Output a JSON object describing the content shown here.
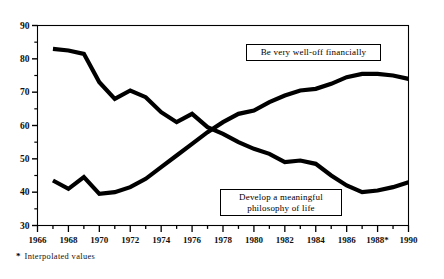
{
  "chart_data": {
    "type": "line",
    "title": "",
    "subtitle": "",
    "xlabel": "",
    "ylabel": "",
    "xlim": [
      1966,
      1990
    ],
    "ylim": [
      30,
      90
    ],
    "grid": false,
    "legend_position": "inline-callout",
    "y_ticks_major": [
      30,
      40,
      50,
      60,
      70,
      80,
      90
    ],
    "y_ticks_minor": [
      35,
      45,
      55,
      65,
      75,
      85
    ],
    "x_ticks_major": [
      "1966",
      "1968",
      "1970",
      "1972",
      "1974",
      "1976",
      "1978",
      "1980",
      "1982",
      "1984",
      "1986",
      "1988*",
      "1990"
    ],
    "x_tick_years_all": [
      1966,
      1967,
      1968,
      1969,
      1970,
      1971,
      1972,
      1973,
      1974,
      1975,
      1976,
      1977,
      1978,
      1979,
      1980,
      1981,
      1982,
      1983,
      1984,
      1985,
      1986,
      1987,
      1988,
      1989,
      1990
    ],
    "x": [
      1967,
      1968,
      1969,
      1970,
      1971,
      1972,
      1973,
      1974,
      1975,
      1976,
      1977,
      1978,
      1979,
      1980,
      1981,
      1982,
      1983,
      1984,
      1985,
      1986,
      1987,
      1988,
      1989,
      1990
    ],
    "series": [
      {
        "name": "Be very well-off financially",
        "color": "#000000",
        "values": [
          43.5,
          41.0,
          44.5,
          39.5,
          40.0,
          41.5,
          44.0,
          47.5,
          51.0,
          54.5,
          58.0,
          61.0,
          63.5,
          64.5,
          67.0,
          69.0,
          70.5,
          71.0,
          72.5,
          74.5,
          75.5,
          75.5,
          75.0,
          74.0
        ]
      },
      {
        "name": "Develop a meaningful philosophy of life",
        "color": "#000000",
        "values": [
          83.0,
          82.5,
          81.5,
          73.0,
          68.0,
          70.5,
          68.5,
          64.0,
          61.0,
          63.5,
          59.5,
          57.5,
          55.0,
          53.0,
          51.5,
          49.0,
          49.5,
          48.5,
          45.0,
          42.0,
          40.0,
          40.5,
          41.5,
          43.0
        ]
      }
    ],
    "annotations": [
      {
        "id": "callout-financial",
        "text": "Be very well-off financially",
        "boxed": true
      },
      {
        "id": "callout-philosophy",
        "text": "Develop a meaningful\nphilosophy of life",
        "boxed": true
      }
    ],
    "footnote": {
      "mark": "*",
      "text": "Interpolated values"
    }
  },
  "colors": {
    "line": "#000000",
    "axis": "#000000",
    "background": "#ffffff",
    "text": "#111111"
  }
}
